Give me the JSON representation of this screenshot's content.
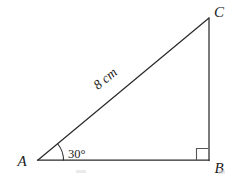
{
  "figure": {
    "background_color": "#ffffff",
    "stroke_color": "#2b2b2b",
    "text_color": "#1c1c1c"
  },
  "vertices": {
    "a": {
      "label": "A",
      "x": 38,
      "y": 160,
      "label_x": 22,
      "label_y": 166
    },
    "b": {
      "label": "B",
      "x": 209,
      "y": 160,
      "label_x": 216,
      "label_y": 173
    },
    "c": {
      "label": "C",
      "x": 209,
      "y": 18,
      "label_x": 216,
      "label_y": 17
    }
  },
  "edges": {
    "hypotenuse": {
      "from": "A",
      "to": "C",
      "length_label": "8 cm"
    },
    "vertical": {
      "from": "C",
      "to": "B"
    },
    "base": {
      "from": "A",
      "to": "B"
    }
  },
  "labels": {
    "side_length": "8 cm",
    "angle_at_a": "30°",
    "right_angle_at_b": "90°"
  },
  "markers": {
    "angle_arc_at_a": true,
    "right_angle_square_at_b": true
  }
}
